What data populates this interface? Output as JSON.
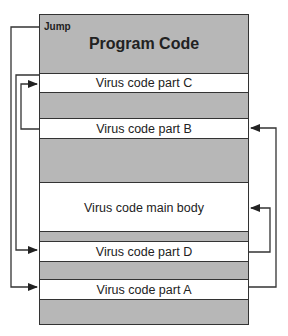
{
  "diagram": {
    "header": {
      "jump_label": "Jump",
      "title": "Program Code"
    },
    "segments": [
      {
        "label": "Virus code part C"
      },
      {
        "label": "Virus code part B"
      },
      {
        "label": "Virus code main body"
      },
      {
        "label": "Virus code part D"
      },
      {
        "label": "Virus code part A"
      }
    ],
    "colors": {
      "program_code": "#b7b7b7",
      "virus_code": "#ffffff",
      "lines": "#333333"
    },
    "flow": [
      "Jump",
      "Virus code part A",
      "Virus code part B",
      "Virus code part C",
      "Virus code part D",
      "Virus code main body"
    ]
  }
}
